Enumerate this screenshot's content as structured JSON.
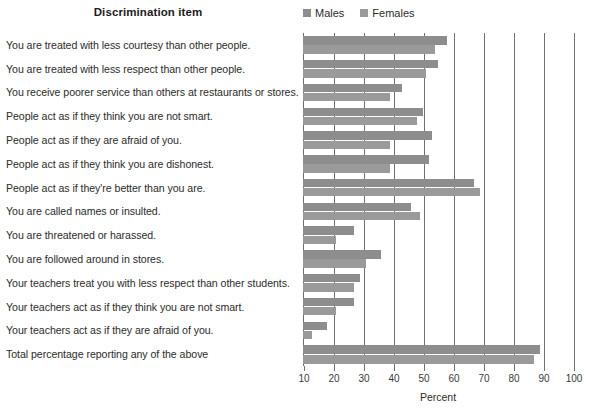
{
  "header": {
    "column_title": "Discrimination item",
    "axis_title": "Percent"
  },
  "legend": [
    {
      "label": "Males",
      "color": "#8d8d8d",
      "icon": "square-swatch-icon"
    },
    {
      "label": "Females",
      "color": "#9a9a9a",
      "icon": "square-swatch-icon"
    }
  ],
  "chart_data": {
    "type": "bar",
    "orientation": "horizontal",
    "title": "Discrimination item",
    "xlabel": "Percent",
    "ylabel": "",
    "xlim": [
      10,
      100
    ],
    "xticks": [
      10,
      20,
      30,
      40,
      50,
      60,
      70,
      80,
      90,
      100
    ],
    "grid": true,
    "legend_position": "top-right",
    "categories": [
      "You are treated with less courtesy than other people.",
      "You are treated with less respect than other people.",
      "You receive poorer service than others at restaurants or stores.",
      "People act as if they think you are not smart.",
      "People act as if they are afraid of you.",
      "People act as if they think you are dishonest.",
      "People act as if they're better than you are.",
      "You are called names or insulted.",
      "You are threatened or harassed.",
      "You are followed around in stores.",
      "Your teachers treat you with less respect than other students.",
      "Your teachers act as if they think you are not smart.",
      "Your teachers act as if they are afraid of you.",
      "Total percentage reporting any of the above"
    ],
    "series": [
      {
        "name": "Males",
        "color": "#8d8d8d",
        "values": [
          58,
          55,
          43,
          50,
          53,
          52,
          67,
          46,
          27,
          36,
          29,
          27,
          18,
          89
        ]
      },
      {
        "name": "Females",
        "color": "#9a9a9a",
        "values": [
          54,
          51,
          39,
          48,
          39,
          39,
          69,
          49,
          21,
          31,
          27,
          21,
          13,
          87
        ]
      }
    ]
  }
}
